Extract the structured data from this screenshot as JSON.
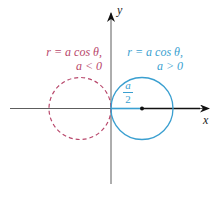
{
  "diagram": {
    "axes": {
      "x_label": "x",
      "y_label": "y"
    },
    "left_curve": {
      "line1": "r = a cos θ,",
      "line2": "a < 0",
      "style": "dashed",
      "color": "#b8476b"
    },
    "right_curve": {
      "line1": "r = a cos θ,",
      "line2": "a > 0",
      "style": "solid",
      "color": "#3a9fd0"
    },
    "radius_label": {
      "numerator": "a",
      "denominator": "2"
    },
    "colors": {
      "axis": "#222222",
      "dashed_circle": "#b8476b",
      "solid_circle": "#3a9fd0"
    }
  }
}
